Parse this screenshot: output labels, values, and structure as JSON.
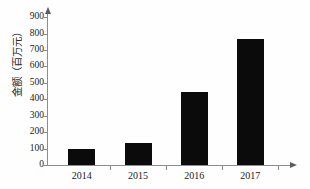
{
  "chart_data": {
    "type": "bar",
    "title": "",
    "subtitle": "",
    "xlabel": "",
    "ylabel": "金额（百万元）",
    "categories": [
      "2014",
      "2015",
      "2016",
      "2017"
    ],
    "values": [
      100,
      133,
      447,
      770
    ],
    "ylim": [
      0,
      950
    ],
    "ytick_labels": [
      "0",
      "100",
      "200",
      "300",
      "400",
      "500",
      "600",
      "700",
      "800",
      "900"
    ],
    "ytick_values": [
      0,
      100,
      200,
      300,
      400,
      500,
      600,
      700,
      800,
      900
    ],
    "grid": false,
    "legend": null,
    "bar_color": "#0b0b0b",
    "axis_color": "#8d8d8d",
    "background_color": "#fefefe",
    "annotations": []
  },
  "axes": {
    "y_title": "金额（百万元）",
    "y_arrow_icon": "arrow-up-icon",
    "x_arrow_icon": "arrow-right-icon"
  }
}
